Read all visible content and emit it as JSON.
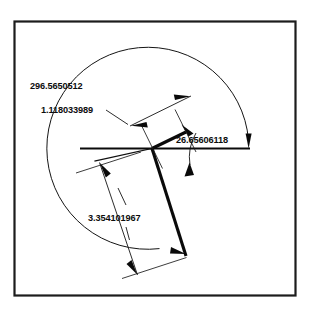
{
  "drawing": {
    "title": "Angular and linear dimension drawing",
    "background_color": "#ffffff",
    "line_color": "#0a0a0a",
    "frame_color": "#1c1c1c",
    "dimensions": [
      {
        "id": "arc-angle",
        "label": "296.5650512",
        "kind": "angular",
        "unit": "degrees",
        "value": 296.5650512,
        "text_x": 30,
        "text_y": 89
      },
      {
        "id": "upper-length",
        "label": "1.118033989",
        "kind": "linear",
        "value": 1.118033989,
        "text_x": 41,
        "text_y": 113
      },
      {
        "id": "vertex-angle",
        "label": "26.65606118",
        "kind": "angular",
        "unit": "degrees",
        "value": 26.65606118,
        "text_x": 176,
        "text_y": 143
      },
      {
        "id": "lower-length",
        "label": "3.354101967",
        "kind": "linear",
        "value": 3.354101967,
        "text_x": 88,
        "text_y": 221
      }
    ]
  }
}
